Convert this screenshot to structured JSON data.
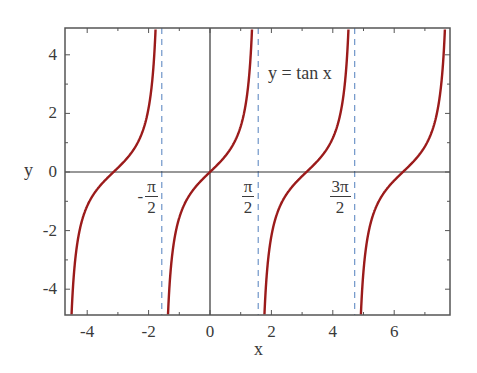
{
  "chart_data": {
    "type": "line",
    "title": "",
    "annotation": "y = tan x",
    "xlabel": "x",
    "ylabel": "y",
    "xlim": [
      -4.72,
      7.82
    ],
    "ylim": [
      -4.9,
      4.9
    ],
    "x_ticks": [
      -4,
      -2,
      0,
      2,
      4,
      6
    ],
    "x_tick_labels": [
      "-4",
      "-2",
      "0",
      "2",
      "4",
      "6"
    ],
    "y_ticks": [
      -4,
      -2,
      0,
      2,
      4
    ],
    "y_tick_labels": [
      "-4",
      "-2",
      "0",
      "2",
      "4"
    ],
    "x_minor_step": 1,
    "y_minor_step": 1,
    "grid": false,
    "series": [
      {
        "name": "tan x",
        "function": "tan",
        "color": "#9b1b1b"
      }
    ],
    "asymptotes": [
      {
        "x": -1.5708,
        "label_sign": "-",
        "label_num": "π",
        "label_den": "2"
      },
      {
        "x": 1.5708,
        "label_sign": "",
        "label_num": "π",
        "label_den": "2"
      },
      {
        "x": 4.7124,
        "label_sign": "",
        "label_num": "3π",
        "label_den": "2"
      }
    ],
    "sample_points": [
      {
        "x": -4.5,
        "y": -4.64
      },
      {
        "x": -3.1416,
        "y": 0
      },
      {
        "x": -1.8,
        "y": 4.29
      },
      {
        "x": -1.37,
        "y": -4.92
      },
      {
        "x": 0,
        "y": 0
      },
      {
        "x": 1.37,
        "y": 4.92
      },
      {
        "x": 1.8,
        "y": -4.29
      },
      {
        "x": 3.1416,
        "y": 0
      },
      {
        "x": 4.5,
        "y": 4.64
      },
      {
        "x": 4.92,
        "y": -4.83
      },
      {
        "x": 6.2832,
        "y": 0
      },
      {
        "x": 7.6,
        "y": 4.43
      }
    ],
    "colors": {
      "curve": "#9b1b1b",
      "asymptote": "#6f95c9",
      "axis": "#333333",
      "frame": "#555555"
    }
  },
  "layout": {
    "plot_left": 65,
    "plot_top": 28,
    "plot_right": 450,
    "plot_bottom": 315,
    "origin_px_x": 210,
    "origin_px_y": 172,
    "px_per_x": 30.7,
    "px_per_y": 29.3
  }
}
